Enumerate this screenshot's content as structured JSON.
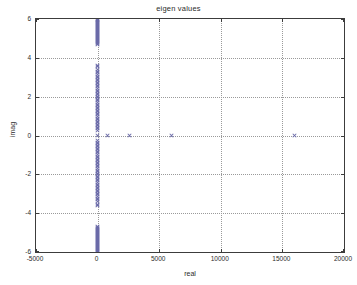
{
  "chart_data": {
    "type": "scatter",
    "title": "eigen values",
    "xlabel": "real",
    "ylabel": "imag",
    "xlim": [
      -5000,
      20000
    ],
    "ylim": [
      -6,
      6
    ],
    "xticks": [
      -5000,
      0,
      5000,
      10000,
      15000,
      20000
    ],
    "yticks": [
      6,
      4,
      2,
      0,
      -2,
      -4,
      -6
    ],
    "xticklabels": [
      "-5000",
      "0",
      "5000",
      "10000",
      "15000",
      "20000"
    ],
    "yticklabels": [
      "6",
      "4",
      "2",
      "0",
      "-2",
      "-4",
      "-6"
    ],
    "grid": true,
    "legend": false,
    "marker": "x",
    "marker_color": "#6a6aa8",
    "series": [
      {
        "name": "eigenvalues",
        "points": [
          [
            0,
            6.0
          ],
          [
            0,
            5.95
          ],
          [
            0,
            5.9
          ],
          [
            0,
            5.85
          ],
          [
            0,
            5.8
          ],
          [
            0,
            5.75
          ],
          [
            0,
            5.7
          ],
          [
            0,
            5.65
          ],
          [
            0,
            5.6
          ],
          [
            0,
            5.55
          ],
          [
            0,
            5.5
          ],
          [
            0,
            5.45
          ],
          [
            0,
            5.4
          ],
          [
            0,
            5.35
          ],
          [
            0,
            5.3
          ],
          [
            0,
            5.25
          ],
          [
            0,
            5.2
          ],
          [
            0,
            5.15
          ],
          [
            0,
            5.1
          ],
          [
            0,
            5.05
          ],
          [
            0,
            5.0
          ],
          [
            0,
            4.95
          ],
          [
            0,
            4.9
          ],
          [
            0,
            4.85
          ],
          [
            0,
            4.8
          ],
          [
            0,
            4.75
          ],
          [
            0,
            4.7
          ],
          [
            0,
            3.62
          ],
          [
            0,
            3.55
          ],
          [
            0,
            3.38
          ],
          [
            0,
            3.3
          ],
          [
            0,
            3.22
          ],
          [
            0,
            3.14
          ],
          [
            0,
            3.06
          ],
          [
            0,
            2.98
          ],
          [
            0,
            2.9
          ],
          [
            0,
            2.82
          ],
          [
            0,
            2.74
          ],
          [
            0,
            2.66
          ],
          [
            0,
            2.58
          ],
          [
            0,
            2.5
          ],
          [
            0,
            2.42
          ],
          [
            0,
            2.34
          ],
          [
            0,
            2.26
          ],
          [
            0,
            2.18
          ],
          [
            0,
            2.1
          ],
          [
            0,
            2.02
          ],
          [
            0,
            1.94
          ],
          [
            0,
            1.86
          ],
          [
            0,
            1.78
          ],
          [
            0,
            1.7
          ],
          [
            0,
            1.62
          ],
          [
            0,
            1.54
          ],
          [
            0,
            1.46
          ],
          [
            0,
            1.38
          ],
          [
            0,
            1.3
          ],
          [
            0,
            1.22
          ],
          [
            0,
            1.14
          ],
          [
            0,
            1.06
          ],
          [
            0,
            0.98
          ],
          [
            0,
            0.9
          ],
          [
            0,
            0.82
          ],
          [
            0,
            0.74
          ],
          [
            0,
            0.66
          ],
          [
            0,
            0.58
          ],
          [
            0,
            0.5
          ],
          [
            0,
            0.42
          ],
          [
            0,
            0.34
          ],
          [
            0,
            0.26
          ],
          [
            0,
            0.0
          ],
          [
            0,
            -0.26
          ],
          [
            0,
            -0.34
          ],
          [
            0,
            -0.42
          ],
          [
            0,
            -0.5
          ],
          [
            0,
            -0.58
          ],
          [
            0,
            -0.66
          ],
          [
            0,
            -0.74
          ],
          [
            0,
            -0.82
          ],
          [
            0,
            -0.9
          ],
          [
            0,
            -0.98
          ],
          [
            0,
            -1.06
          ],
          [
            0,
            -1.14
          ],
          [
            0,
            -1.22
          ],
          [
            0,
            -1.3
          ],
          [
            0,
            -1.38
          ],
          [
            0,
            -1.46
          ],
          [
            0,
            -1.54
          ],
          [
            0,
            -1.62
          ],
          [
            0,
            -1.7
          ],
          [
            0,
            -1.78
          ],
          [
            0,
            -1.86
          ],
          [
            0,
            -1.94
          ],
          [
            0,
            -2.02
          ],
          [
            0,
            -2.1
          ],
          [
            0,
            -2.18
          ],
          [
            0,
            -2.26
          ],
          [
            0,
            -2.34
          ],
          [
            0,
            -2.42
          ],
          [
            0,
            -2.5
          ],
          [
            0,
            -2.58
          ],
          [
            0,
            -2.66
          ],
          [
            0,
            -2.74
          ],
          [
            0,
            -2.82
          ],
          [
            0,
            -2.9
          ],
          [
            0,
            -2.98
          ],
          [
            0,
            -3.06
          ],
          [
            0,
            -3.14
          ],
          [
            0,
            -3.22
          ],
          [
            0,
            -3.3
          ],
          [
            0,
            -3.38
          ],
          [
            0,
            -3.55
          ],
          [
            0,
            -3.62
          ],
          [
            0,
            -4.7
          ],
          [
            0,
            -4.75
          ],
          [
            0,
            -4.8
          ],
          [
            0,
            -4.85
          ],
          [
            0,
            -4.9
          ],
          [
            0,
            -4.95
          ],
          [
            0,
            -5.0
          ],
          [
            0,
            -5.05
          ],
          [
            0,
            -5.1
          ],
          [
            0,
            -5.15
          ],
          [
            0,
            -5.2
          ],
          [
            0,
            -5.25
          ],
          [
            0,
            -5.3
          ],
          [
            0,
            -5.35
          ],
          [
            0,
            -5.4
          ],
          [
            0,
            -5.45
          ],
          [
            0,
            -5.5
          ],
          [
            0,
            -5.55
          ],
          [
            0,
            -5.6
          ],
          [
            0,
            -5.65
          ],
          [
            0,
            -5.7
          ],
          [
            0,
            -5.75
          ],
          [
            0,
            -5.8
          ],
          [
            0,
            -5.85
          ],
          [
            0,
            -5.9
          ],
          [
            0,
            -5.95
          ],
          [
            0,
            -6.0
          ],
          [
            800,
            0.0
          ],
          [
            2600,
            0.0
          ],
          [
            6000,
            0.0
          ],
          [
            16000,
            0.0
          ]
        ]
      }
    ]
  }
}
